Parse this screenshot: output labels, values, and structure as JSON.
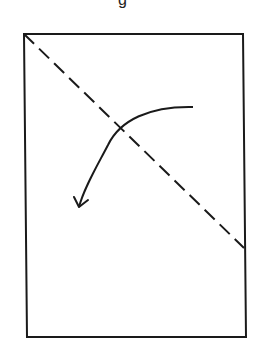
{
  "diagram": {
    "caption_fragment": "g",
    "colors": {
      "stroke": "#1a1a1a",
      "background": "#ffffff"
    },
    "sheet": {
      "corners": {
        "top_left": [
          24,
          34
        ],
        "top_right": [
          243,
          34
        ],
        "bottom_right": [
          246,
          337
        ],
        "bottom_left": [
          27,
          337
        ]
      },
      "stroke_width": 2
    },
    "fold_line": {
      "style": "dashed",
      "from": [
        24,
        34
      ],
      "to": [
        244,
        248
      ],
      "dash": "14 7"
    },
    "fold_arrow": {
      "path": "M193,107 C150,106 120,120 108,145 C96,168 84,188 79,207",
      "arrowhead": "M74,197 L79,207 L88,200",
      "direction": "counter-clockwise fold toward lower-left"
    }
  }
}
